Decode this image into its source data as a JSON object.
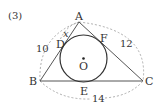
{
  "problem_label": "(3)",
  "points": {
    "A": "A",
    "B": "B",
    "C": "C",
    "D": "D",
    "E": "E",
    "F": "F",
    "O": "O"
  },
  "lengths": {
    "AB": "10",
    "AC": "12",
    "BC": "14",
    "AD": "x"
  },
  "colors": {
    "stroke": "#555555",
    "circle": "#333333",
    "dashed": "#999999",
    "text": "#333333"
  }
}
